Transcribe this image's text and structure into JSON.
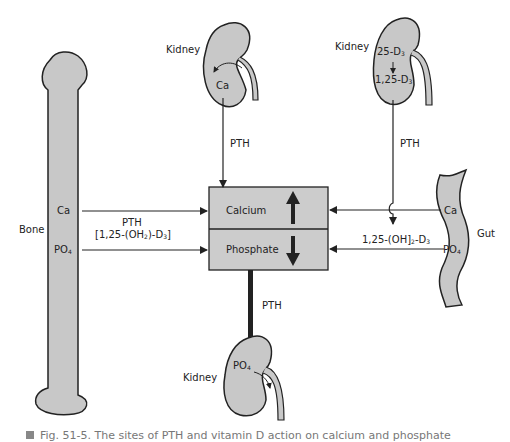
{
  "diagram": {
    "colors": {
      "organ_fill": "#c8c8c8",
      "box_fill": "#cccccc",
      "stroke": "#222222",
      "background": "#ffffff"
    },
    "central_box": {
      "top_label": "Calcium",
      "bottom_label": "Phosphate",
      "top_arrow": "up",
      "bottom_arrow": "down"
    },
    "kidney_top_left": {
      "label": "Kidney",
      "inner_text": "Ca",
      "arrow_label": "PTH"
    },
    "kidney_top_right": {
      "label": "Kidney",
      "inner_text_top": "25-D",
      "inner_text_top_sub": "3",
      "inner_text_bottom": "1,25-D",
      "inner_text_bottom_sub": "3",
      "arrow_label": "PTH",
      "output_label_a": "1,25-(OH]",
      "output_label_sub1": "2",
      "output_label_b": "-D",
      "output_label_sub2": "3"
    },
    "bone": {
      "label": "Bone",
      "ca_label": "Ca",
      "po4_label": "PO",
      "po4_sub": "4",
      "arrow_label_1": "PTH",
      "arrow_label_2a": "[1,25-(OH",
      "arrow_label_2_sub1": "2",
      "arrow_label_2b": ")-D",
      "arrow_label_2_sub2": "3",
      "arrow_label_2c": "]"
    },
    "gut": {
      "label": "Gut",
      "ca_label": "Ca",
      "po4_label": "PO",
      "po4_sub": "4"
    },
    "kidney_bottom": {
      "label": "Kidney",
      "inner_text": "PO",
      "inner_sub": "4",
      "arrow_label": "PTH"
    },
    "caption": "Fig. 51-5. The sites of PTH and vitamin D action on calcium and phosphate"
  }
}
